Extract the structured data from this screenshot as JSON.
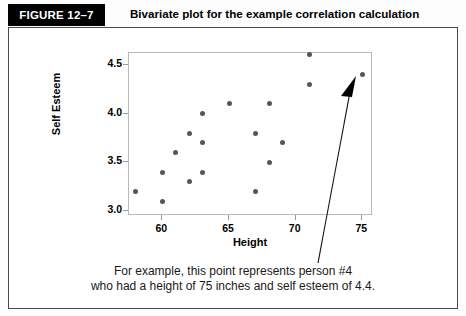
{
  "header": {
    "badge_label": "FIGURE 12–7",
    "title": "Bivariate plot for the example correlation calculation"
  },
  "caption": {
    "line1": "For example, this point represents person #4",
    "line2": "who had a height of 75 inches and self esteem of 4.4."
  },
  "annotation": {
    "arrow_name": "callout-arrow",
    "target_point": {
      "x": 75,
      "y": 4.4
    }
  },
  "colors": {
    "badge_background": "#000000",
    "badge_text": "#ffffff",
    "frame_border": "#4a4a4a",
    "plot_border": "#b9b9b9",
    "point_fill": "#55565a",
    "axis_tick": "#9b9b9b",
    "caption_text": "#1a1a1a"
  },
  "chart_data": {
    "type": "scatter",
    "title": "Bivariate plot for the example correlation calculation",
    "xlabel": "Height",
    "ylabel": "Self Esteem",
    "xlim": [
      57.5,
      75.8
    ],
    "ylim": [
      2.95,
      4.62
    ],
    "xticks": [
      60,
      65,
      70,
      75
    ],
    "yticks": [
      3.0,
      3.5,
      4.0,
      4.5
    ],
    "xtick_labels": [
      "60",
      "65",
      "70",
      "75"
    ],
    "ytick_labels": [
      "3.0",
      "3.5",
      "4.0",
      "4.5"
    ],
    "grid": false,
    "legend": false,
    "series": [
      {
        "name": "Height vs Self Esteem",
        "points": [
          {
            "x": 58,
            "y": 3.2
          },
          {
            "x": 60,
            "y": 3.4
          },
          {
            "x": 60,
            "y": 3.1
          },
          {
            "x": 61,
            "y": 3.6
          },
          {
            "x": 62,
            "y": 3.8
          },
          {
            "x": 62,
            "y": 3.3
          },
          {
            "x": 63,
            "y": 4.0
          },
          {
            "x": 63,
            "y": 3.7
          },
          {
            "x": 63,
            "y": 3.4
          },
          {
            "x": 65,
            "y": 4.1
          },
          {
            "x": 67,
            "y": 3.8
          },
          {
            "x": 67,
            "y": 3.2
          },
          {
            "x": 68,
            "y": 4.1
          },
          {
            "x": 68,
            "y": 3.5
          },
          {
            "x": 69,
            "y": 3.7
          },
          {
            "x": 71,
            "y": 4.6
          },
          {
            "x": 71,
            "y": 4.3
          },
          {
            "x": 75,
            "y": 4.4
          }
        ]
      }
    ]
  }
}
